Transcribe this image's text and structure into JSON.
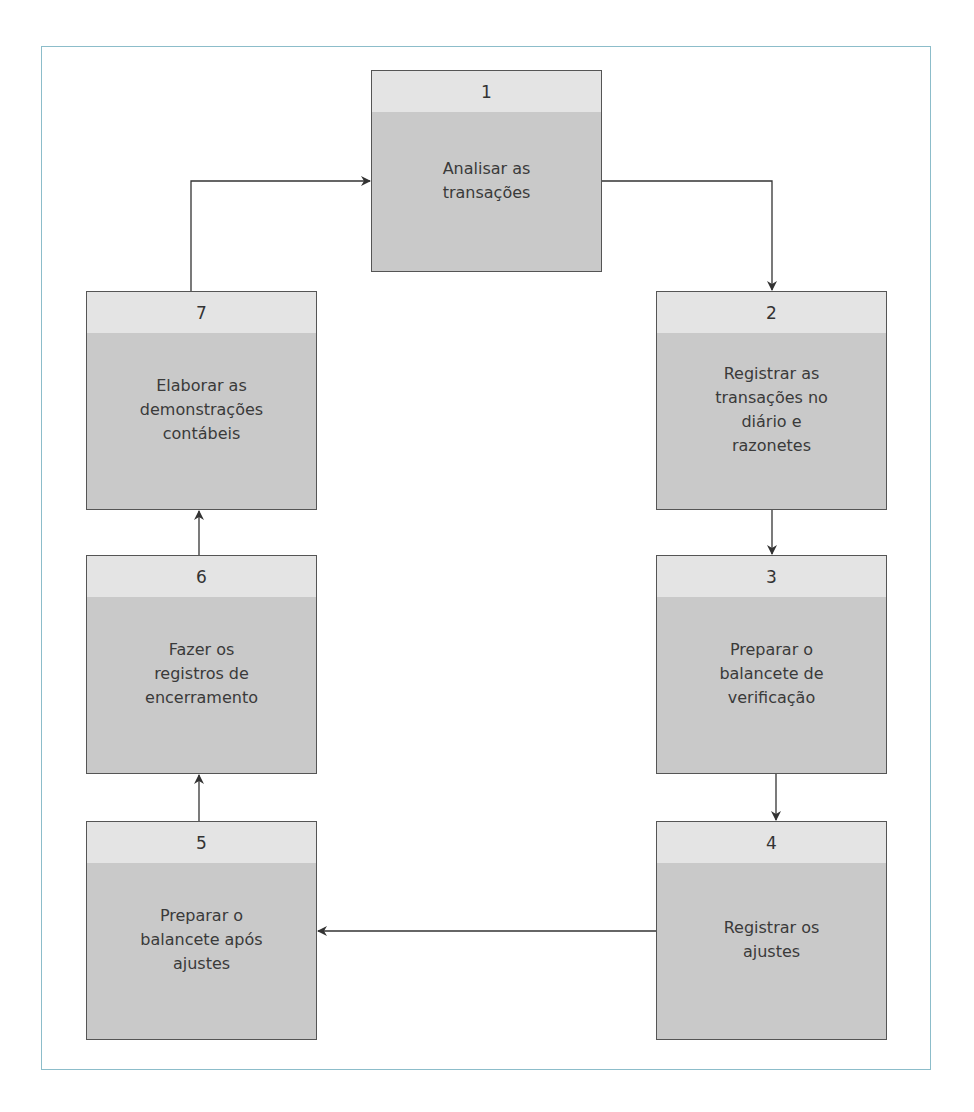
{
  "diagram": {
    "type": "cycle-flowchart",
    "colors": {
      "frame_border": "#8cbdca",
      "box_border": "#555555",
      "box_header_fill": "#e4e4e4",
      "box_body_fill": "#c9c9c9",
      "arrow": "#333333",
      "text": "#3a3a3a"
    },
    "steps": [
      {
        "number": "1",
        "label": "Analisar as\ntransações"
      },
      {
        "number": "2",
        "label": "Registrar as\ntransações no\ndiário e\nrazonetes"
      },
      {
        "number": "3",
        "label": "Preparar o\nbalancete de\nverificação"
      },
      {
        "number": "4",
        "label": "Registrar os\najustes"
      },
      {
        "number": "5",
        "label": "Preparar o\nbalancete após\najustes"
      },
      {
        "number": "6",
        "label": "Fazer os\nregistros de\nencerramento"
      },
      {
        "number": "7",
        "label": "Elaborar as\ndemonstrações\ncontábeis"
      }
    ],
    "flow": [
      {
        "from": "1",
        "to": "2"
      },
      {
        "from": "2",
        "to": "3"
      },
      {
        "from": "3",
        "to": "4"
      },
      {
        "from": "4",
        "to": "5"
      },
      {
        "from": "5",
        "to": "6"
      },
      {
        "from": "6",
        "to": "7"
      },
      {
        "from": "7",
        "to": "1"
      }
    ]
  }
}
